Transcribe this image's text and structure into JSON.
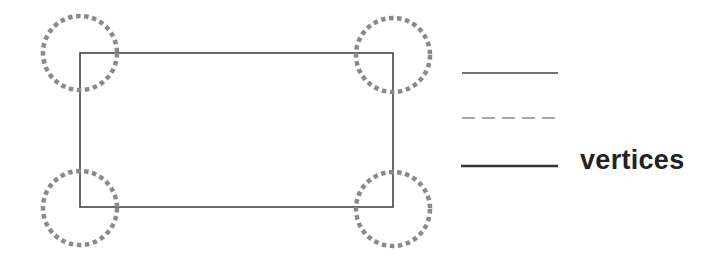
{
  "diagram": {
    "rectangle": {
      "x": 80,
      "y": 53,
      "width": 313,
      "height": 154,
      "stroke": "#444444"
    },
    "vertex_markers": [
      {
        "name": "top-left",
        "cx": 80,
        "cy": 53
      },
      {
        "name": "top-right",
        "cx": 393,
        "cy": 53
      },
      {
        "name": "bottom-left",
        "cx": 80,
        "cy": 207
      },
      {
        "name": "bottom-right",
        "cx": 393,
        "cy": 207
      }
    ],
    "marker_radius": 37,
    "marker_color": "#8a8a8a",
    "legend": [
      {
        "style": "solid-thin",
        "label": ""
      },
      {
        "style": "dashed",
        "label": ""
      },
      {
        "style": "solid-thick",
        "label": "vertices"
      }
    ]
  }
}
